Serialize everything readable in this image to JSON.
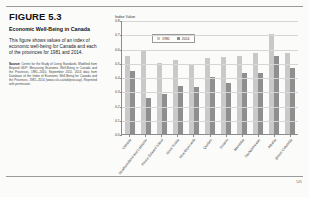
{
  "figure": {
    "number": "FIGURE 5.3",
    "title": "Economic Well-Being in Canada",
    "description": "This figure shows values of an index of economic well-being for Canada and each of the provinces for 1981 and 2014.",
    "source_label": "Source:",
    "source_text": "Centre for the Study of Living Standards. Modified from Beyond GDP: Measuring Economic Well-Being in Canada and the Provinces, 1981–2010, September 2011. 2014 data from Database of the Index of Economic Well-Being for Canada and the Provinces, 1981–2014 (www.csls.ca/iwb/prov.asp). Reprinted with permission."
  },
  "folio": "145",
  "chart_data": {
    "type": "bar",
    "title": "",
    "ylabel": "Index Value",
    "xlabel": "",
    "ylim": [
      0.0,
      0.8
    ],
    "yticks": [
      "0.8",
      "0.7",
      "0.6",
      "0.5",
      "0.4",
      "0.3",
      "0.2",
      "0.1",
      "0.0"
    ],
    "grid": true,
    "legend_position": "top-left",
    "categories": [
      "Canada",
      "Newfoundland and Labrador",
      "Prince Edward Island",
      "Nova Scotia",
      "New Brunswick",
      "Quebec",
      "Ontario",
      "Manitoba",
      "Saskatchewan",
      "Alberta",
      "British Columbia"
    ],
    "series": [
      {
        "name": "1981",
        "color": "#c9c9c9",
        "values": [
          0.55,
          0.58,
          0.5,
          0.52,
          0.49,
          0.53,
          0.54,
          0.55,
          0.57,
          0.7,
          0.57
        ]
      },
      {
        "name": "2014",
        "color": "#8f8f8f",
        "values": [
          0.44,
          0.25,
          0.28,
          0.34,
          0.33,
          0.4,
          0.36,
          0.43,
          0.43,
          0.55,
          0.46
        ]
      }
    ]
  }
}
